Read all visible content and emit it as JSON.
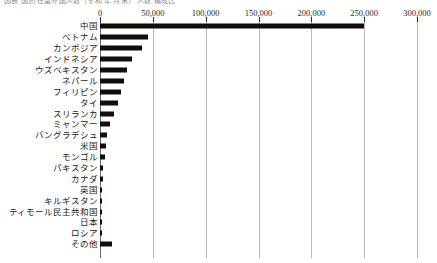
{
  "header": {
    "cropped_text": "図表  国別 在留外国人数（令和 年 月末）  人数  構成比"
  },
  "chart_data": {
    "type": "bar",
    "orientation": "horizontal",
    "title": "",
    "xlabel": "",
    "ylabel": "",
    "xlim": [
      0,
      300000
    ],
    "xticks": [
      0,
      50000,
      100000,
      150000,
      200000,
      250000,
      300000
    ],
    "xtick_labels": [
      "0",
      "50,000",
      "100,000",
      "150,000",
      "200,000",
      "250,000",
      "300,000"
    ],
    "grid": true,
    "legend": false,
    "bar_color": "#100d0a",
    "categories": [
      "中国",
      "ベトナム",
      "カンボジア",
      "インドネシア",
      "ウズベキスタン",
      "ネパール",
      "フィリピン",
      "タイ",
      "スリランカ",
      "ミャンマー",
      "バングラデシュ",
      "米国",
      "モンゴル",
      "パキスタン",
      "カナダ",
      "英国",
      "キルギスタン",
      "ティモール民主共和国",
      "日本",
      "ロシア",
      "その他"
    ],
    "values": [
      250000,
      45000,
      40000,
      30000,
      26000,
      23000,
      20000,
      17000,
      13000,
      9500,
      7000,
      5500,
      4500,
      3000,
      2600,
      2300,
      2000,
      1800,
      1500,
      1000,
      11000
    ]
  }
}
